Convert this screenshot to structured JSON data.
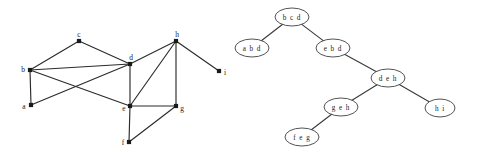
{
  "figure": {
    "background_color": "#ffffff",
    "ink_color": "#1a1a1a",
    "width": 477,
    "height": 159
  },
  "graph": {
    "name": "undirected-graph",
    "vertices": [
      {
        "id": "a",
        "label": "a",
        "x": 31,
        "y": 105,
        "label_dx": -7,
        "label_dy": 1
      },
      {
        "id": "b",
        "label": "b",
        "x": 30,
        "y": 70,
        "label_dx": -7,
        "label_dy": -1
      },
      {
        "id": "c",
        "label": "c",
        "x": 79,
        "y": 41,
        "label_dx": 0,
        "label_dy": -7
      },
      {
        "id": "d",
        "label": "d",
        "x": 130,
        "y": 64,
        "label_dx": 1,
        "label_dy": -7
      },
      {
        "id": "e",
        "label": "e",
        "x": 130,
        "y": 106,
        "label_dx": -6,
        "label_dy": 2
      },
      {
        "id": "f",
        "label": "f",
        "x": 129,
        "y": 142,
        "label_dx": -6,
        "label_dy": 0
      },
      {
        "id": "g",
        "label": "g",
        "x": 176,
        "y": 106,
        "label_dx": 6,
        "label_dy": 2
      },
      {
        "id": "h",
        "label": "h",
        "x": 176,
        "y": 41,
        "label_dx": 1,
        "label_dy": -7
      },
      {
        "id": "i",
        "label": "i",
        "x": 219,
        "y": 71,
        "label_dx": 6,
        "label_dy": 1
      }
    ],
    "edges": [
      {
        "from": "a",
        "to": "b"
      },
      {
        "from": "a",
        "to": "d"
      },
      {
        "from": "b",
        "to": "c"
      },
      {
        "from": "b",
        "to": "d"
      },
      {
        "from": "b",
        "to": "e"
      },
      {
        "from": "c",
        "to": "d"
      },
      {
        "from": "d",
        "to": "e"
      },
      {
        "from": "d",
        "to": "h"
      },
      {
        "from": "e",
        "to": "f"
      },
      {
        "from": "e",
        "to": "g"
      },
      {
        "from": "e",
        "to": "h"
      },
      {
        "from": "f",
        "to": "g"
      },
      {
        "from": "g",
        "to": "h"
      },
      {
        "from": "h",
        "to": "i"
      }
    ]
  },
  "tree": {
    "name": "tree-decomposition",
    "nodes": [
      {
        "id": "bcd",
        "label": "b c d",
        "x": 292,
        "y": 17,
        "rx": 17,
        "ry": 9
      },
      {
        "id": "abd",
        "label": "a b d",
        "x": 252,
        "y": 48,
        "rx": 17,
        "ry": 9
      },
      {
        "id": "ebd",
        "label": "e b d",
        "x": 333,
        "y": 48,
        "rx": 17,
        "ry": 9
      },
      {
        "id": "deh",
        "label": "d e h",
        "x": 388,
        "y": 78,
        "rx": 17,
        "ry": 9
      },
      {
        "id": "geh",
        "label": "g e h",
        "x": 341,
        "y": 107,
        "rx": 17,
        "ry": 9
      },
      {
        "id": "hi",
        "label": "h i",
        "x": 440,
        "y": 108,
        "rx": 15,
        "ry": 9
      },
      {
        "id": "feg",
        "label": "f e g",
        "x": 302,
        "y": 137,
        "rx": 17,
        "ry": 9
      }
    ],
    "edges": [
      {
        "from": "bcd",
        "to": "abd"
      },
      {
        "from": "bcd",
        "to": "ebd"
      },
      {
        "from": "ebd",
        "to": "deh"
      },
      {
        "from": "deh",
        "to": "geh"
      },
      {
        "from": "deh",
        "to": "hi"
      },
      {
        "from": "geh",
        "to": "feg"
      }
    ]
  }
}
